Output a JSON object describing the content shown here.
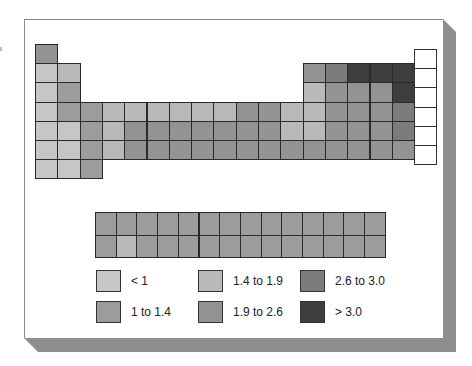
{
  "chart_data": {
    "type": "heatmap",
    "title": "",
    "colors": {
      "lt1": "#c6c6c6",
      "1to1.4": "#9c9c9c",
      "1.4to1.9": "#b9b9b9",
      "1.9to2.6": "#939393",
      "2.6to3.0": "#7c7c7c",
      "gt3": "#3e3e3e",
      "noble": "#ffffff"
    },
    "legend": [
      {
        "key": "lt1",
        "label": "< 1"
      },
      {
        "key": "1to1.4",
        "label": "1 to 1.4"
      },
      {
        "key": "1.4to1.9",
        "label": "1.4 to 1.9"
      },
      {
        "key": "1.9to2.6",
        "label": "1.9 to 2.6"
      },
      {
        "key": "2.6to3.0",
        "label": "2.6 to 3.0"
      },
      {
        "key": "gt3",
        "label": "> 3.0"
      }
    ],
    "main_table": [
      {
        "period": 1,
        "cells": [
          [
            1,
            "1.9to2.6"
          ],
          [
            18,
            "noble"
          ]
        ]
      },
      {
        "period": 2,
        "cells": [
          [
            1,
            "lt1"
          ],
          [
            2,
            "1.4to1.9"
          ],
          [
            13,
            "1.9to2.6"
          ],
          [
            14,
            "2.6to3.0"
          ],
          [
            15,
            "gt3"
          ],
          [
            16,
            "gt3"
          ],
          [
            17,
            "gt3"
          ],
          [
            18,
            "noble"
          ]
        ]
      },
      {
        "period": 3,
        "cells": [
          [
            1,
            "lt1"
          ],
          [
            2,
            "1to1.4"
          ],
          [
            13,
            "1.4to1.9"
          ],
          [
            14,
            "1.9to2.6"
          ],
          [
            15,
            "1.9to2.6"
          ],
          [
            16,
            "1.9to2.6"
          ],
          [
            17,
            "gt3"
          ],
          [
            18,
            "noble"
          ]
        ]
      },
      {
        "period": 4,
        "cells": [
          [
            1,
            "lt1"
          ],
          [
            2,
            "1to1.4"
          ],
          [
            3,
            "1to1.4"
          ],
          [
            4,
            "1.4to1.9"
          ],
          [
            5,
            "1.4to1.9"
          ],
          [
            6,
            "1.4to1.9"
          ],
          [
            7,
            "1.4to1.9"
          ],
          [
            8,
            "1.4to1.9"
          ],
          [
            9,
            "1.4to1.9"
          ],
          [
            10,
            "1.9to2.6"
          ],
          [
            11,
            "1.9to2.6"
          ],
          [
            12,
            "1.4to1.9"
          ],
          [
            13,
            "1.4to1.9"
          ],
          [
            14,
            "1.9to2.6"
          ],
          [
            15,
            "1.9to2.6"
          ],
          [
            16,
            "1.9to2.6"
          ],
          [
            17,
            "2.6to3.0"
          ],
          [
            18,
            "noble"
          ]
        ]
      },
      {
        "period": 5,
        "cells": [
          [
            1,
            "lt1"
          ],
          [
            2,
            "lt1"
          ],
          [
            3,
            "1to1.4"
          ],
          [
            4,
            "1.4to1.9"
          ],
          [
            5,
            "1.9to2.6"
          ],
          [
            6,
            "1.9to2.6"
          ],
          [
            7,
            "1.9to2.6"
          ],
          [
            8,
            "1.9to2.6"
          ],
          [
            9,
            "1.9to2.6"
          ],
          [
            10,
            "1.9to2.6"
          ],
          [
            11,
            "1.9to2.6"
          ],
          [
            12,
            "1.4to1.9"
          ],
          [
            13,
            "1.4to1.9"
          ],
          [
            14,
            "1.9to2.6"
          ],
          [
            15,
            "1.9to2.6"
          ],
          [
            16,
            "1.9to2.6"
          ],
          [
            17,
            "2.6to3.0"
          ],
          [
            18,
            "noble"
          ]
        ]
      },
      {
        "period": 6,
        "cells": [
          [
            1,
            "lt1"
          ],
          [
            2,
            "lt1"
          ],
          [
            3,
            "1to1.4"
          ],
          [
            4,
            "1.4to1.9"
          ],
          [
            5,
            "1.9to2.6"
          ],
          [
            6,
            "1.9to2.6"
          ],
          [
            7,
            "1.9to2.6"
          ],
          [
            8,
            "1.9to2.6"
          ],
          [
            9,
            "1.9to2.6"
          ],
          [
            10,
            "1.9to2.6"
          ],
          [
            11,
            "1.9to2.6"
          ],
          [
            12,
            "1.9to2.6"
          ],
          [
            13,
            "1.9to2.6"
          ],
          [
            14,
            "1.9to2.6"
          ],
          [
            15,
            "1.9to2.6"
          ],
          [
            16,
            "1.9to2.6"
          ],
          [
            17,
            "1.9to2.6"
          ],
          [
            18,
            "noble"
          ]
        ]
      },
      {
        "period": 7,
        "cells": [
          [
            1,
            "lt1"
          ],
          [
            2,
            "lt1"
          ],
          [
            3,
            "1to1.4"
          ]
        ]
      }
    ],
    "f_block": [
      [
        "1to1.4",
        "1to1.4",
        "1to1.4",
        "1to1.4",
        "1to1.4",
        "1to1.4",
        "1to1.4",
        "1to1.4",
        "1to1.4",
        "1to1.4",
        "1to1.4",
        "1to1.4",
        "1to1.4",
        "1to1.4"
      ],
      [
        "1to1.4",
        "1.4to1.9",
        "1to1.4",
        "1to1.4",
        "1to1.4",
        "1to1.4",
        "1to1.4",
        "1to1.4",
        "1to1.4",
        "1to1.4",
        "1to1.4",
        "1to1.4",
        "1to1.4",
        "1to1.4"
      ]
    ]
  }
}
